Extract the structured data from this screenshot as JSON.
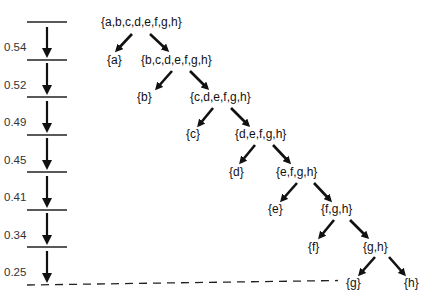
{
  "diagram": {
    "type": "hierarchical-split-tree",
    "scale": {
      "values": [
        "0.54",
        "0.52",
        "0.49",
        "0.45",
        "0.41",
        "0.34",
        "0.25"
      ]
    },
    "nodes": {
      "n0": "{a,b,c,d,e,f,g,h}",
      "a": "{a}",
      "n1": "{b,c,d,e,f,g,h}",
      "b": "{b}",
      "n2": "{c,d,e,f,g,h}",
      "c": "{c}",
      "n3": "{d,e,f,g,h}",
      "d": "{d}",
      "n4": "{e,f,g,h}",
      "e": "{e}",
      "n5": "{f,g,h}",
      "f": "{f}",
      "n6": "{g,h}",
      "g": "{g}",
      "h": "{h}"
    },
    "edges": [
      [
        "n0",
        "a"
      ],
      [
        "n0",
        "n1"
      ],
      [
        "n1",
        "b"
      ],
      [
        "n1",
        "n2"
      ],
      [
        "n2",
        "c"
      ],
      [
        "n2",
        "n3"
      ],
      [
        "n3",
        "d"
      ],
      [
        "n3",
        "n4"
      ],
      [
        "n4",
        "e"
      ],
      [
        "n4",
        "n5"
      ],
      [
        "n5",
        "f"
      ],
      [
        "n5",
        "n6"
      ],
      [
        "n6",
        "g"
      ],
      [
        "n6",
        "h"
      ]
    ],
    "colors": {
      "ink": "#111111",
      "value_text": "#333333"
    }
  }
}
